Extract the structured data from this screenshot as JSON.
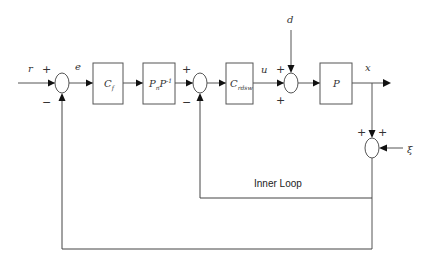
{
  "diagram": {
    "type": "control-block-diagram",
    "signals": {
      "reference": "r",
      "error": "e",
      "control": "u",
      "disturbance": "d",
      "output": "x",
      "noise": "ξ"
    },
    "blocks": [
      {
        "id": "cf",
        "main": "C",
        "sub": "f",
        "sup": ""
      },
      {
        "id": "pnp",
        "main": "P",
        "sub": "n",
        "main2": "P",
        "sup": "-1"
      },
      {
        "id": "crdsw",
        "main": "C",
        "sub": "rdsw",
        "sup": ""
      },
      {
        "id": "plant",
        "main": "P",
        "sub": "",
        "sup": ""
      }
    ],
    "junctions": [
      {
        "id": "sum1",
        "signs": {
          "top": "+",
          "bottom": "−"
        }
      },
      {
        "id": "sum2",
        "signs": {
          "top": "+",
          "bottom": "−"
        }
      },
      {
        "id": "sum3",
        "signs": {
          "top": "+",
          "bottom": "+"
        }
      },
      {
        "id": "sum4",
        "signs": {
          "left": "+",
          "right": "+"
        }
      }
    ],
    "loops": {
      "inner_label": "Inner Loop"
    },
    "colors": {
      "line": "#555555",
      "arrow": "#111111",
      "text": "#333333",
      "background": "#ffffff"
    }
  }
}
